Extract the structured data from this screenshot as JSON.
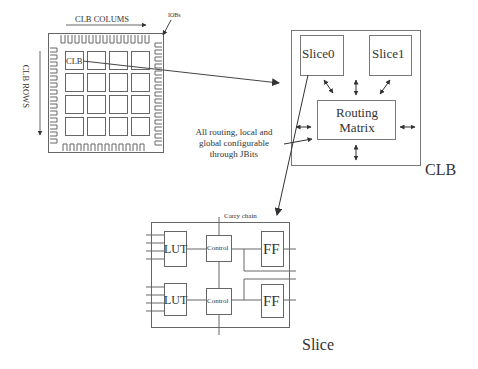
{
  "figure": {
    "fpga": {
      "columns_label": "CLB COLUMS",
      "rows_label": "CLB ROWS",
      "iobs_label": "IOBs",
      "clb_cell_label": "CLB",
      "grid": {
        "rows": 4,
        "cols": 4
      }
    },
    "clb": {
      "title": "CLB",
      "slice0": "Slice0",
      "slice1": "Slice1",
      "routing_matrix_line1": "Routing",
      "routing_matrix_line2": "Matrix"
    },
    "annotation": {
      "line1": "All routing, local and",
      "line2": "global configurable",
      "line3": "through JBits"
    },
    "slice": {
      "title": "Slice",
      "carry_chain": "Carry chain",
      "lut_top": "LUT",
      "lut_bottom": "LUT",
      "control_top": "Control",
      "control_bottom": "Control",
      "ff_top": "FF",
      "ff_bottom": "FF"
    },
    "colors": {
      "stroke": "#555555",
      "text": "#333333",
      "background": "#ffffff"
    }
  }
}
